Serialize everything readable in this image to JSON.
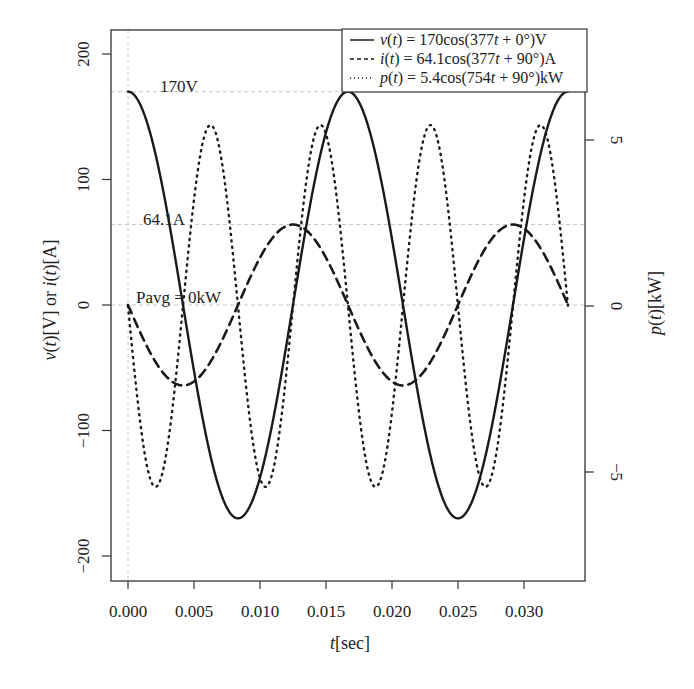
{
  "chart_data": {
    "type": "line",
    "title": "",
    "xlabel": "t[sec]",
    "ylabel_left": "v(t)[V] or i(t)[A]",
    "ylabel_right": "p(t)[kW]",
    "xlim": [
      -0.0013,
      0.0348
    ],
    "ylim_left": [
      -220,
      220
    ],
    "ylim_right": [
      -8.3,
      8.3
    ],
    "x_ticks": [
      0.0,
      0.005,
      0.01,
      0.015,
      0.02,
      0.025,
      0.03
    ],
    "x_tick_labels": [
      "0.000",
      "0.005",
      "0.010",
      "0.015",
      "0.020",
      "0.025",
      "0.030"
    ],
    "y_ticks_left": [
      200,
      100,
      0,
      -100,
      -200
    ],
    "y_tick_labels_left": [
      "200",
      "100",
      "0",
      "−100",
      "−200"
    ],
    "y_ticks_right": [
      5,
      0,
      -5
    ],
    "y_tick_labels_right": [
      "5",
      "0",
      "−5"
    ],
    "t_range": [
      0,
      0.03333
    ],
    "series": [
      {
        "name": "v(t) = 170cos(377t + 0°)V",
        "axis": "left",
        "amplitude": 170,
        "omega": 377,
        "phase_deg": 0,
        "style": "solid",
        "unit": "V"
      },
      {
        "name": "i(t) = 64.1cos(377t + 90°)A",
        "axis": "left",
        "amplitude": 64.1,
        "omega": 377,
        "phase_deg": 90,
        "style": "dashed",
        "unit": "A"
      },
      {
        "name": "p(t) = 5.4cos(754t + 90°)kW",
        "axis": "right",
        "amplitude": 5.45,
        "omega": 754,
        "phase_deg": 90,
        "style": "dotted",
        "unit": "kW"
      }
    ],
    "sample_points": {
      "t": [
        0.0,
        0.00208,
        0.00417,
        0.00625,
        0.00833,
        0.01042,
        0.0125,
        0.01458,
        0.01667,
        0.01875,
        0.02083,
        0.02292,
        0.025,
        0.02708,
        0.02917,
        0.03125,
        0.03333
      ],
      "v": [
        170,
        120.2,
        0,
        -120.2,
        -170,
        -120.2,
        0,
        120.2,
        170,
        120.2,
        0,
        -120.2,
        -170,
        -120.2,
        0,
        120.2,
        170
      ],
      "i": [
        0,
        -45.3,
        -64.1,
        -45.3,
        0,
        45.3,
        64.1,
        45.3,
        0,
        -45.3,
        -64.1,
        -45.3,
        0,
        45.3,
        64.1,
        45.3,
        0
      ],
      "p": [
        0,
        -5.45,
        0,
        5.45,
        0,
        -5.45,
        0,
        5.45,
        0,
        -5.45,
        0,
        5.45,
        0,
        -5.45,
        0,
        5.45,
        0
      ]
    },
    "reference_lines": [
      {
        "axis": "left",
        "value": 170,
        "label": "170V"
      },
      {
        "axis": "left",
        "value": 64.1,
        "label": "64.1A"
      },
      {
        "axis": "left",
        "value": 0,
        "label": "Pavg = 0kW"
      }
    ],
    "legend_position": "top-right",
    "grid": false
  },
  "legend": {
    "items": [
      {
        "symbol": "solid",
        "prefix": "v",
        "text": " = 170cos(377",
        "suffix": " + 0°)V"
      },
      {
        "symbol": "dashed",
        "prefix": "i",
        "text": " = 64.1cos(377",
        "suffix": " + 90°)A"
      },
      {
        "symbol": "dotted",
        "prefix": "p",
        "text": " = 5.4cos(754",
        "suffix": " + 90°)kW"
      }
    ]
  },
  "annotations": {
    "voltage_peak": "170V",
    "current_peak": "64.1A",
    "avg_power": "Pavg = 0kW"
  },
  "colors": {
    "line": "#1a1a1a",
    "axis": "#333333",
    "refline": "#c8c8c8"
  }
}
